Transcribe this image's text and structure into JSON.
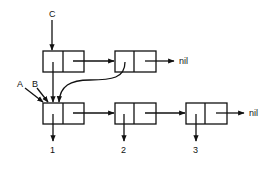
{
  "diagram": {
    "type": "linked-list cons cells",
    "pointer_labels": {
      "c": "C",
      "a": "A",
      "b": "B"
    },
    "terminators": {
      "top_nil": "nil",
      "bottom_nil": "nil"
    },
    "values": [
      "1",
      "2",
      "3"
    ],
    "top_row": [
      {
        "id": "top-cell-1",
        "car": "points to bottom-cell-1",
        "cdr": "top-cell-2"
      },
      {
        "id": "top-cell-2",
        "car": "points to bottom-cell-1",
        "cdr": "nil"
      }
    ],
    "bottom_row": [
      {
        "id": "bottom-cell-1",
        "car": "1",
        "cdr": "bottom-cell-2"
      },
      {
        "id": "bottom-cell-2",
        "car": "2",
        "cdr": "bottom-cell-3"
      },
      {
        "id": "bottom-cell-3",
        "car": "3",
        "cdr": "nil"
      }
    ],
    "colors": {
      "stroke": "#111111",
      "background": "#ffffff"
    }
  }
}
